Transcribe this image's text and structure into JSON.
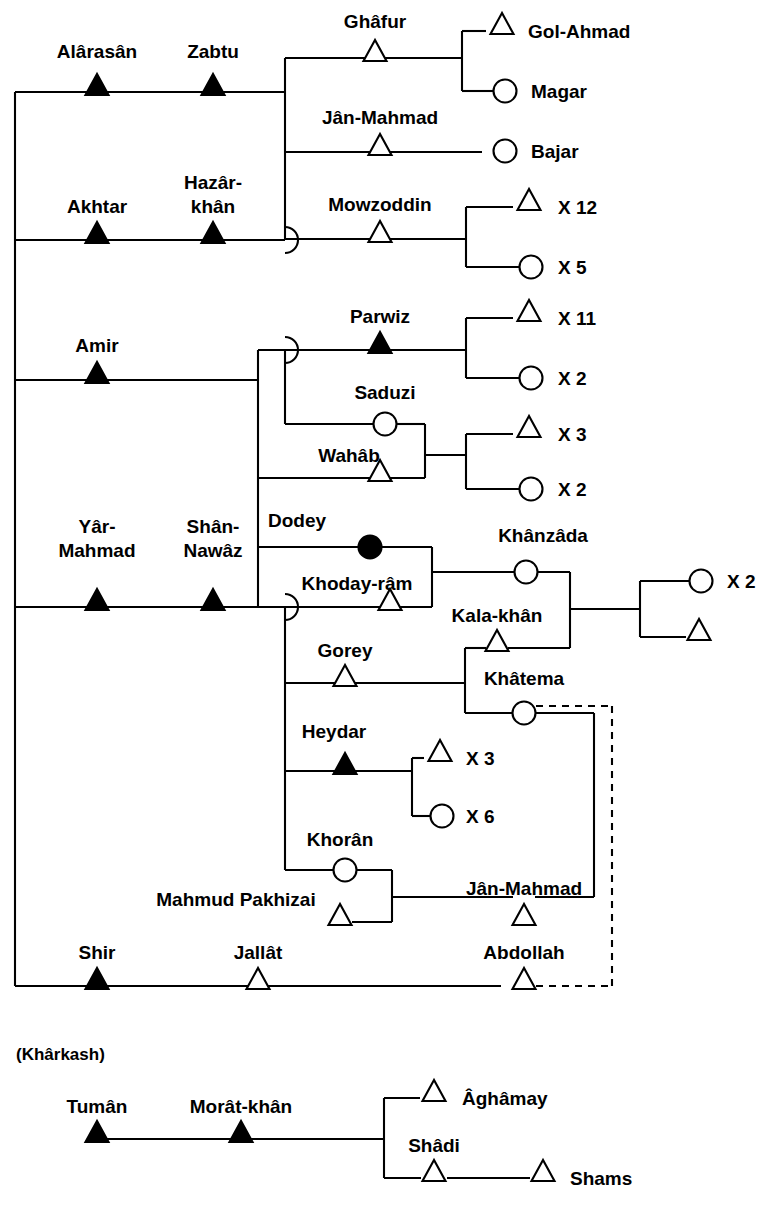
{
  "diagram": {
    "type": "kinship-genealogy",
    "width": 767,
    "height": 1205,
    "colors": {
      "line": "#000000",
      "filled_node": "#000000",
      "open_node": "#ffffff",
      "background": "#ffffff"
    },
    "legend_semantics": {
      "filled_triangle": "deceased / focal male",
      "open_triangle": "male",
      "filled_circle": "deceased / focal female",
      "open_circle": "female",
      "dashed_line": "inferred or alternate link"
    },
    "group_labels": [
      {
        "id": "kharkash",
        "text": "(Khârkash)",
        "x": 16,
        "y": 1060
      }
    ],
    "persons": [
      {
        "id": "alarasan",
        "name": "Alârasân",
        "sex": "male",
        "filled": true,
        "x": 97,
        "y": 92,
        "label_x": 97,
        "label_y": 58,
        "anchor": "middle"
      },
      {
        "id": "zabtu",
        "name": "Zabtu",
        "sex": "male",
        "filled": true,
        "x": 213,
        "y": 92,
        "label_x": 213,
        "label_y": 58,
        "anchor": "middle"
      },
      {
        "id": "ghafur",
        "name": "Ghâfur",
        "sex": "male",
        "filled": false,
        "x": 375,
        "y": 58,
        "label_x": 375,
        "label_y": 28,
        "anchor": "middle"
      },
      {
        "id": "golahmad",
        "name": "Gol-Ahmad",
        "sex": "male",
        "filled": false,
        "x": 502,
        "y": 31,
        "label_x": 528,
        "label_y": 38,
        "anchor": "start"
      },
      {
        "id": "magar",
        "name": "Magar",
        "sex": "female",
        "filled": false,
        "x": 505,
        "y": 91,
        "label_x": 531,
        "label_y": 98,
        "anchor": "start"
      },
      {
        "id": "janmahmad1",
        "name": "Jân-Mahmad",
        "sex": "male",
        "filled": false,
        "x": 380,
        "y": 152,
        "label_x": 380,
        "label_y": 124,
        "anchor": "middle"
      },
      {
        "id": "bajar",
        "name": "Bajar",
        "sex": "female",
        "filled": false,
        "x": 505,
        "y": 151,
        "label_x": 531,
        "label_y": 158,
        "anchor": "start"
      },
      {
        "id": "akhtar",
        "name": "Akhtar",
        "sex": "male",
        "filled": true,
        "x": 97,
        "y": 240,
        "label_x": 97,
        "label_y": 213,
        "anchor": "middle"
      },
      {
        "id": "hazarkhan",
        "name": "Hazâr-\nkhân",
        "sex": "male",
        "filled": true,
        "x": 213,
        "y": 240,
        "label_x": 213,
        "label_y": 189,
        "anchor": "middle"
      },
      {
        "id": "mowzoddin",
        "name": "Mowzoddin",
        "sex": "male",
        "filled": false,
        "x": 380,
        "y": 239,
        "label_x": 380,
        "label_y": 211,
        "anchor": "middle"
      },
      {
        "id": "mowz_sons",
        "name": "X 12",
        "sex": "male",
        "filled": false,
        "x": 529,
        "y": 207,
        "label_x": 558,
        "label_y": 214,
        "anchor": "start"
      },
      {
        "id": "mowz_daus",
        "name": "X 5",
        "sex": "female",
        "filled": false,
        "x": 531,
        "y": 267,
        "label_x": 558,
        "label_y": 274,
        "anchor": "start"
      },
      {
        "id": "amir",
        "name": "Amir",
        "sex": "male",
        "filled": true,
        "x": 97,
        "y": 380,
        "label_x": 97,
        "label_y": 352,
        "anchor": "middle"
      },
      {
        "id": "parwiz",
        "name": "Parwiz",
        "sex": "male",
        "filled": true,
        "x": 380,
        "y": 350,
        "label_x": 380,
        "label_y": 323,
        "anchor": "middle"
      },
      {
        "id": "parw_sons",
        "name": "X 11",
        "sex": "male",
        "filled": false,
        "x": 529,
        "y": 318,
        "label_x": 558,
        "label_y": 325,
        "anchor": "start"
      },
      {
        "id": "parw_daus",
        "name": "X 2",
        "sex": "female",
        "filled": false,
        "x": 531,
        "y": 378,
        "label_x": 558,
        "label_y": 385,
        "anchor": "start"
      },
      {
        "id": "saduzi",
        "name": "Saduzi",
        "sex": "female",
        "filled": false,
        "x": 385,
        "y": 424,
        "label_x": 385,
        "label_y": 399,
        "anchor": "middle"
      },
      {
        "id": "wahab",
        "name": "Wahâb",
        "sex": "male",
        "filled": false,
        "x": 380,
        "y": 478,
        "label_x": 349,
        "label_y": 462,
        "anchor": "middle"
      },
      {
        "id": "sad_sons",
        "name": "X 3",
        "sex": "male",
        "filled": false,
        "x": 529,
        "y": 434,
        "label_x": 558,
        "label_y": 441,
        "anchor": "start"
      },
      {
        "id": "sad_daus",
        "name": "X 2",
        "sex": "female",
        "filled": false,
        "x": 531,
        "y": 489,
        "label_x": 558,
        "label_y": 496,
        "anchor": "start"
      },
      {
        "id": "yarmahmad",
        "name": "Yâr-\nMahmad",
        "sex": "male",
        "filled": true,
        "x": 97,
        "y": 607,
        "label_x": 97,
        "label_y": 533,
        "anchor": "middle"
      },
      {
        "id": "shannawaz",
        "name": "Shân-\nNawâz",
        "sex": "male",
        "filled": true,
        "x": 213,
        "y": 607,
        "label_x": 213,
        "label_y": 533,
        "anchor": "middle"
      },
      {
        "id": "dodey",
        "name": "Dodey",
        "sex": "female",
        "filled": true,
        "x": 370,
        "y": 547,
        "label_x": 297,
        "label_y": 527,
        "anchor": "middle"
      },
      {
        "id": "khodayram",
        "name": "Khoday-râm",
        "sex": "male",
        "filled": false,
        "x": 390,
        "y": 607,
        "label_x": 357,
        "label_y": 590,
        "anchor": "middle"
      },
      {
        "id": "khanzada",
        "name": "Khânzâda",
        "sex": "female",
        "filled": false,
        "x": 526,
        "y": 572,
        "label_x": 543,
        "label_y": 542,
        "anchor": "middle"
      },
      {
        "id": "kalakhan",
        "name": "Kala-khân",
        "sex": "male",
        "filled": false,
        "x": 497,
        "y": 648,
        "label_x": 497,
        "label_y": 622,
        "anchor": "middle"
      },
      {
        "id": "far_dau",
        "name": "X 2",
        "sex": "female",
        "filled": false,
        "x": 701,
        "y": 581,
        "label_x": 727,
        "label_y": 588,
        "anchor": "start"
      },
      {
        "id": "far_son",
        "name": "",
        "sex": "male",
        "filled": false,
        "x": 699,
        "y": 637,
        "label_x": 727,
        "label_y": 644,
        "anchor": "start"
      },
      {
        "id": "gorey",
        "name": "Gorey",
        "sex": "male",
        "filled": false,
        "x": 345,
        "y": 683,
        "label_x": 345,
        "label_y": 657,
        "anchor": "middle"
      },
      {
        "id": "khatema",
        "name": "Khâtema",
        "sex": "female",
        "filled": false,
        "x": 524,
        "y": 713,
        "label_x": 524,
        "label_y": 685,
        "anchor": "middle"
      },
      {
        "id": "heydar",
        "name": "Heydar",
        "sex": "male",
        "filled": true,
        "x": 345,
        "y": 771,
        "label_x": 334,
        "label_y": 738,
        "anchor": "middle"
      },
      {
        "id": "hey_sons",
        "name": "X 3",
        "sex": "male",
        "filled": false,
        "x": 440,
        "y": 758,
        "label_x": 466,
        "label_y": 765,
        "anchor": "start"
      },
      {
        "id": "hey_daus",
        "name": "X 6",
        "sex": "female",
        "filled": false,
        "x": 442,
        "y": 816,
        "label_x": 466,
        "label_y": 823,
        "anchor": "start"
      },
      {
        "id": "khoran",
        "name": "Khorân",
        "sex": "female",
        "filled": false,
        "x": 345,
        "y": 870,
        "label_x": 340,
        "label_y": 846,
        "anchor": "middle"
      },
      {
        "id": "mahmudpakh",
        "name": "Mahmud Pakhizai",
        "sex": "male",
        "filled": false,
        "x": 340,
        "y": 922,
        "label_x": 236,
        "label_y": 906,
        "anchor": "middle"
      },
      {
        "id": "janmahmad2",
        "name": "Jân-Mahmad",
        "sex": "male",
        "filled": false,
        "x": 524,
        "y": 922,
        "label_x": 524,
        "label_y": 895,
        "anchor": "middle"
      },
      {
        "id": "shir",
        "name": "Shir",
        "sex": "male",
        "filled": true,
        "x": 97,
        "y": 986,
        "label_x": 97,
        "label_y": 959,
        "anchor": "middle"
      },
      {
        "id": "jallat",
        "name": "Jallât",
        "sex": "male",
        "filled": false,
        "x": 258,
        "y": 986,
        "label_x": 258,
        "label_y": 959,
        "anchor": "middle"
      },
      {
        "id": "abdollah",
        "name": "Abdollah",
        "sex": "male",
        "filled": false,
        "x": 524,
        "y": 986,
        "label_x": 524,
        "label_y": 959,
        "anchor": "middle"
      },
      {
        "id": "tuman",
        "name": "Tumân",
        "sex": "male",
        "filled": true,
        "x": 97,
        "y": 1139,
        "label_x": 97,
        "label_y": 1113,
        "anchor": "middle"
      },
      {
        "id": "moratkhan",
        "name": "Morât-khân",
        "sex": "male",
        "filled": true,
        "x": 241,
        "y": 1139,
        "label_x": 241,
        "label_y": 1113,
        "anchor": "middle"
      },
      {
        "id": "aghamay",
        "name": "Âghâmay",
        "sex": "male",
        "filled": false,
        "x": 434,
        "y": 1098,
        "label_x": 462,
        "label_y": 1105,
        "anchor": "start"
      },
      {
        "id": "shadi",
        "name": "Shâdi",
        "sex": "male",
        "filled": false,
        "x": 434,
        "y": 1178,
        "label_x": 434,
        "label_y": 1152,
        "anchor": "middle"
      },
      {
        "id": "shams",
        "name": "Shams",
        "sex": "male",
        "filled": false,
        "x": 543,
        "y": 1178,
        "label_x": 570,
        "label_y": 1185,
        "anchor": "start"
      }
    ],
    "edges": [
      {
        "id": "spine-left",
        "d": "M 15 92 L 15 986",
        "dashed": false
      },
      {
        "id": "row-alarasan",
        "d": "M 15 92 L 285 92",
        "dashed": false
      },
      {
        "id": "row-akhtar",
        "d": "M 15 240 L 285 240",
        "dashed": false
      },
      {
        "id": "row-amir",
        "d": "M 15 380 L 258 380",
        "dashed": false
      },
      {
        "id": "row-yarmahmad",
        "d": "M 15 607 L 285 607",
        "dashed": false
      },
      {
        "id": "row-shir",
        "d": "M 15 986 L 501 986",
        "dashed": false
      },
      {
        "id": "sib-vert-top",
        "d": "M 285 58 L 285 240",
        "dashed": false
      },
      {
        "id": "ghafur-line",
        "d": "M 285 58 L 462 58",
        "dashed": false
      },
      {
        "id": "janmahmad1-line",
        "d": "M 285 152 L 482 152",
        "dashed": false
      },
      {
        "id": "ghafur-kids-vert",
        "d": "M 462 31 L 462 91",
        "dashed": false
      },
      {
        "id": "ghafur-son-arm",
        "d": "M 462 31 L 486 31",
        "dashed": false
      },
      {
        "id": "ghafur-dau-arm",
        "d": "M 462 91 L 494 91",
        "dashed": false
      },
      {
        "id": "mowzoddin-line",
        "d": "M 285 239 L 466 239",
        "dashed": false
      },
      {
        "id": "mowz-kids-vert",
        "d": "M 466 207 L 466 267",
        "dashed": false
      },
      {
        "id": "mowz-son-arm",
        "d": "M 466 207 L 513 207",
        "dashed": false
      },
      {
        "id": "mowz-dau-arm",
        "d": "M 466 267 L 520 267",
        "dashed": false
      },
      {
        "id": "sib-vert-amir",
        "d": "M 258 350 L 258 607",
        "dashed": false
      },
      {
        "id": "parwiz-line",
        "d": "M 258 350 L 466 350",
        "dashed": false
      },
      {
        "id": "parw-kids-vert",
        "d": "M 466 318 L 466 378",
        "dashed": false
      },
      {
        "id": "parw-son-arm",
        "d": "M 466 318 L 513 318",
        "dashed": false
      },
      {
        "id": "parw-dau-arm",
        "d": "M 466 378 L 520 378",
        "dashed": false
      },
      {
        "id": "saduzi-line",
        "d": "M 285 424 L 374 424",
        "dashed": false
      },
      {
        "id": "saduzi-vert",
        "d": "M 285 350 L 285 424",
        "dashed": false
      },
      {
        "id": "saduzi-right",
        "d": "M 396 424 L 425 424",
        "dashed": false
      },
      {
        "id": "wahab-line",
        "d": "M 258 478 L 425 478",
        "dashed": false
      },
      {
        "id": "wahab-union-vert",
        "d": "M 425 424 L 425 478",
        "dashed": false
      },
      {
        "id": "wahab-union-out",
        "d": "M 425 455 L 466 455",
        "dashed": false
      },
      {
        "id": "wahab-kids-vert",
        "d": "M 466 434 L 466 489",
        "dashed": false
      },
      {
        "id": "wahab-son-arm",
        "d": "M 466 434 L 513 434",
        "dashed": false
      },
      {
        "id": "wahab-dau-arm",
        "d": "M 466 489 L 520 489",
        "dashed": false
      },
      {
        "id": "dodey-line",
        "d": "M 258 547 L 359 547",
        "dashed": false
      },
      {
        "id": "dodey-right",
        "d": "M 381 547 L 432 547",
        "dashed": false
      },
      {
        "id": "khodayram-line",
        "d": "M 285 607 L 432 607",
        "dashed": false
      },
      {
        "id": "khoday-union-vert",
        "d": "M 432 547 L 432 607",
        "dashed": false
      },
      {
        "id": "khoday-union-out",
        "d": "M 432 572 L 515 572",
        "dashed": false
      },
      {
        "id": "khanzada-right",
        "d": "M 537 572 L 570 572",
        "dashed": false
      },
      {
        "id": "kala-right",
        "d": "M 508 648 L 570 648",
        "dashed": false
      },
      {
        "id": "kala-union-vert",
        "d": "M 570 572 L 570 648",
        "dashed": false
      },
      {
        "id": "kala-union-out",
        "d": "M 570 609 L 640 609",
        "dashed": false
      },
      {
        "id": "far-kids-vert",
        "d": "M 640 581 L 640 637",
        "dashed": false
      },
      {
        "id": "far-dau-arm",
        "d": "M 640 581 L 690 581",
        "dashed": false
      },
      {
        "id": "far-son-arm",
        "d": "M 640 637 L 686 637",
        "dashed": false
      },
      {
        "id": "gorey-line",
        "d": "M 285 683 L 465 683",
        "dashed": false
      },
      {
        "id": "gorey-kids-vert",
        "d": "M 465 648 L 465 713",
        "dashed": false
      },
      {
        "id": "gorey-kala-arm",
        "d": "M 465 648 L 486 648",
        "dashed": false
      },
      {
        "id": "gorey-khat-arm",
        "d": "M 465 713 L 513 713",
        "dashed": false
      },
      {
        "id": "sib-vert-lower",
        "d": "M 285 607 L 285 870",
        "dashed": false
      },
      {
        "id": "heydar-line",
        "d": "M 285 771 L 412 771",
        "dashed": false
      },
      {
        "id": "hey-kids-vert",
        "d": "M 412 758 L 412 816",
        "dashed": false
      },
      {
        "id": "hey-son-arm",
        "d": "M 412 758 L 424 758",
        "dashed": false
      },
      {
        "id": "hey-dau-arm",
        "d": "M 412 816 L 431 816",
        "dashed": false
      },
      {
        "id": "khoran-line",
        "d": "M 285 870 L 334 870",
        "dashed": false
      },
      {
        "id": "khoran-right",
        "d": "M 356 870 L 392 870",
        "dashed": false
      },
      {
        "id": "mahmudpakh-line",
        "d": "M 352 922 L 392 922",
        "dashed": false
      },
      {
        "id": "khoran-union-vert",
        "d": "M 392 870 L 392 922",
        "dashed": false
      },
      {
        "id": "khoran-union-out",
        "d": "M 392 897 L 513 897",
        "dashed": false
      },
      {
        "id": "janmahmad2-line",
        "d": "M 392 897 L 513 897",
        "dashed": false
      },
      {
        "id": "janmahmad2-right",
        "d": "M 535 897 L 594 897",
        "dashed": false
      },
      {
        "id": "khatema-down",
        "d": "M 594 713 L 594 897",
        "dashed": false
      },
      {
        "id": "khatema-to-vert",
        "d": "M 535 713 L 594 713",
        "dashed": false
      },
      {
        "id": "khatema-dash-top",
        "d": "M 536 706 L 612 706",
        "dashed": true
      },
      {
        "id": "khatema-dash-vert",
        "d": "M 612 706 L 612 986",
        "dashed": true
      },
      {
        "id": "abdollah-dash",
        "d": "M 536 986 L 612 986",
        "dashed": true
      },
      {
        "id": "kharkash-row",
        "d": "M 97 1139 L 384 1139",
        "dashed": false
      },
      {
        "id": "kharkash-vert",
        "d": "M 384 1098 L 384 1178",
        "dashed": false
      },
      {
        "id": "aghamay-arm",
        "d": "M 384 1098 L 420 1098",
        "dashed": false
      },
      {
        "id": "shadi-arm",
        "d": "M 384 1178 L 421 1178",
        "dashed": false
      },
      {
        "id": "shadi-shams",
        "d": "M 447 1178 L 530 1178",
        "dashed": false
      }
    ],
    "arcs": [
      {
        "id": "arc-akhtar",
        "cx": 285,
        "cy": 240
      },
      {
        "id": "arc-parwiz",
        "cx": 285,
        "cy": 350
      },
      {
        "id": "arc-yarmahmad",
        "cx": 285,
        "cy": 607
      }
    ]
  },
  "chart_data": {
    "type": "diagram",
    "nodes": 44,
    "generations": 4
  }
}
